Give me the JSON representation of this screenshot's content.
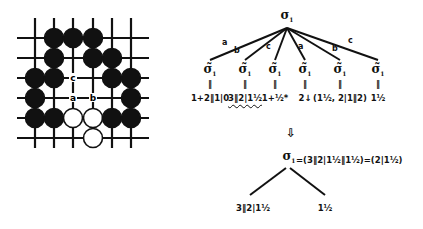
{
  "board": {
    "grid_size": 6,
    "x_lines": [
      35,
      54,
      73,
      93,
      112,
      131
    ],
    "y_lines": [
      38,
      58,
      78,
      98,
      118,
      138
    ],
    "stones": [
      {
        "col": 1,
        "row": 0,
        "color": "black"
      },
      {
        "col": 2,
        "row": 0,
        "color": "black"
      },
      {
        "col": 3,
        "row": 0,
        "color": "black"
      },
      {
        "col": 1,
        "row": 1,
        "color": "black"
      },
      {
        "col": 3,
        "row": 1,
        "color": "black"
      },
      {
        "col": 4,
        "row": 1,
        "color": "black"
      },
      {
        "col": 0,
        "row": 2,
        "color": "black"
      },
      {
        "col": 1,
        "row": 2,
        "color": "black"
      },
      {
        "col": 4,
        "row": 2,
        "color": "black"
      },
      {
        "col": 5,
        "row": 2,
        "color": "black"
      },
      {
        "col": 0,
        "row": 3,
        "color": "black"
      },
      {
        "col": 5,
        "row": 3,
        "color": "black"
      },
      {
        "col": 0,
        "row": 4,
        "color": "black"
      },
      {
        "col": 1,
        "row": 4,
        "color": "black"
      },
      {
        "col": 2,
        "row": 4,
        "color": "white"
      },
      {
        "col": 3,
        "row": 4,
        "color": "white"
      },
      {
        "col": 4,
        "row": 4,
        "color": "black"
      },
      {
        "col": 5,
        "row": 4,
        "color": "black"
      },
      {
        "col": 3,
        "row": 5,
        "color": "white"
      }
    ],
    "point_labels": [
      {
        "col": 2,
        "row": 2,
        "label": "c"
      },
      {
        "col": 2,
        "row": 3,
        "label": "a"
      },
      {
        "col": 3,
        "row": 3,
        "label": "b"
      }
    ]
  },
  "tree": {
    "root": {
      "symbol": "σ",
      "subscript": "1"
    },
    "branches": [
      {
        "edge_label": "a",
        "child_symbol": "σ̃",
        "child_subscript": "1",
        "child_superscript": "1",
        "value": "1+2‖1|0",
        "wavy": false
      },
      {
        "edge_label": "b",
        "child_symbol": "σ̃",
        "child_subscript": "1",
        "child_superscript": "1",
        "value": "3‖2|1½",
        "wavy": true
      },
      {
        "edge_label": "c",
        "child_symbol": "σ̃",
        "child_subscript": "1",
        "child_superscript": "1",
        "value": "1+½*",
        "wavy": false
      },
      {
        "edge_label": "a",
        "child_symbol": "σ̃",
        "child_subscript": "1",
        "child_superscript": "r",
        "value": "2↓",
        "wavy": false
      },
      {
        "edge_label": "b",
        "child_symbol": "σ̃",
        "child_subscript": "1",
        "child_superscript": "r",
        "value": "(1½, 2|1‖2)",
        "wavy": false
      },
      {
        "edge_label": "c",
        "child_symbol": "σ̃",
        "child_subscript": "1",
        "child_superscript": "r",
        "value": "1½",
        "wavy": true
      }
    ],
    "equals_sign": "‖",
    "arrow": "⇩"
  },
  "result": {
    "root_symbol": "σ",
    "root_subscript": "1",
    "equation": "=(3‖2|1½‖1½)=(2|1½)",
    "left_value": "3‖2|1½",
    "right_value": "1½"
  }
}
